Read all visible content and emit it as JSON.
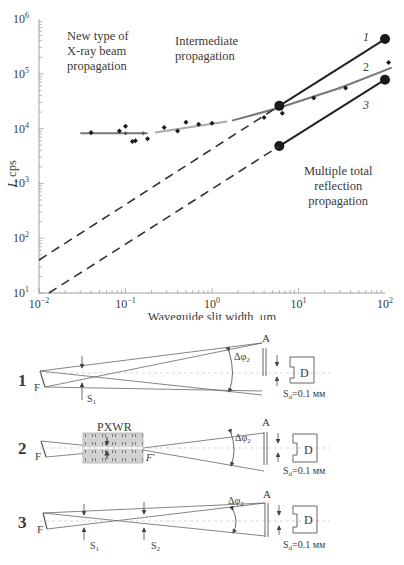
{
  "figure": {
    "annotations": {
      "new_type": [
        "New type of",
        "X-ray beam",
        "propagation"
      ],
      "intermediate": [
        "Intermediate",
        "propagation"
      ],
      "multiple": [
        "Multiple total",
        "reflection",
        "propagation"
      ]
    },
    "curve_labels": [
      "1",
      "2",
      "3"
    ],
    "diagram": {
      "rows": [
        {
          "number": "1",
          "source": "F",
          "slits": [
            "S1"
          ],
          "aperture": "A",
          "angle": "Δφ2",
          "detector": "D",
          "detector_slit": "Sd=0.1 мм"
        },
        {
          "number": "2",
          "source": "F",
          "waveguide": "PXWR",
          "focus": "F'",
          "aperture": "A",
          "angle": "Δφ2",
          "detector": "D",
          "detector_slit": "Sd=0.1 мм"
        },
        {
          "number": "3",
          "source": "F",
          "slits": [
            "S1",
            "S2"
          ],
          "aperture": "A",
          "angle": "Δφ2",
          "detector": "D",
          "detector_slit": "Sd=0.1 мм"
        }
      ]
    }
  },
  "chart_data": {
    "type": "scatter",
    "title": "",
    "xlabel": "Waveguide slit width, μm",
    "ylabel": "I, cps",
    "xscale": "log",
    "yscale": "log",
    "xlim": [
      0.01,
      100
    ],
    "ylim": [
      10,
      1000000
    ],
    "x_ticks": [
      "10^-2",
      "10^-1",
      "10^0",
      "10^1",
      "10^2"
    ],
    "y_ticks": [
      "10^1",
      "10^2",
      "10^3",
      "10^4",
      "10^5",
      "10^6"
    ],
    "grid": false,
    "series": [
      {
        "name": "measured (new type)",
        "style": "markers",
        "x": [
          0.04,
          0.085,
          0.13,
          0.1,
          0.12,
          0.18
        ],
        "y": [
          8500,
          9000,
          6000,
          11000,
          5800,
          6500
        ]
      },
      {
        "name": "measured (intermediate)",
        "style": "markers",
        "x": [
          0.28,
          0.4,
          0.5,
          0.7,
          1.0,
          4.0,
          6.5,
          15,
          35,
          110
        ],
        "y": [
          10500,
          9000,
          13000,
          12000,
          12500,
          16000,
          19000,
          36000,
          55000,
          160000
        ]
      },
      {
        "name": "fit plateau",
        "style": "line-gray",
        "x": [
          0.03,
          0.18
        ],
        "y": [
          8200,
          8200
        ]
      },
      {
        "name": "fit intermediate",
        "style": "line-lightgray",
        "x": [
          0.22,
          1.5
        ],
        "y": [
          8500,
          13500
        ]
      },
      {
        "name": "2",
        "style": "line-gray",
        "x": [
          1.7,
          6,
          30,
          120
        ],
        "y": [
          14000,
          24000,
          55000,
          130000
        ]
      },
      {
        "name": "1",
        "style": "line-black",
        "x": [
          6,
          100
        ],
        "y": [
          26000,
          430000
        ]
      },
      {
        "name": "3",
        "style": "line-black",
        "x": [
          6,
          100
        ],
        "y": [
          4800,
          78000
        ]
      },
      {
        "name": "1 extrapolation",
        "style": "dashed",
        "x": [
          0.01,
          6
        ],
        "y": [
          40,
          26000
        ]
      },
      {
        "name": "3 extrapolation",
        "style": "dashed",
        "x": [
          0.013,
          6
        ],
        "y": [
          10,
          4800
        ]
      }
    ]
  }
}
